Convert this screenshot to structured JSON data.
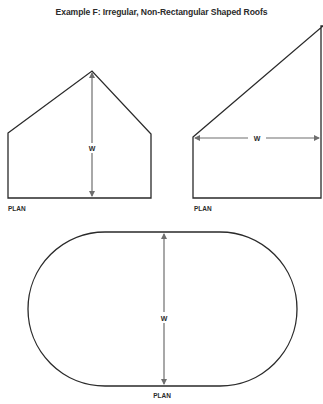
{
  "title": "Example F: Irregular, Non-Rectangular Shaped Roofs",
  "colors": {
    "outline": "#2a2a2a",
    "dimension_arrow": "#6e6e6e",
    "text": "#2b2b2b",
    "background": "#ffffff"
  },
  "figures": [
    {
      "id": "pentagon",
      "description": "Five-sided plan with gabled point",
      "dimension_label": "W",
      "plan_label": "PLAN"
    },
    {
      "id": "trapezoid",
      "description": "Four-sided plan with sloped top edge",
      "dimension_label": "W",
      "plan_label": "PLAN"
    },
    {
      "id": "stadium",
      "description": "Rounded-end (stadium) plan",
      "dimension_label": "W",
      "plan_label": "PLAN"
    }
  ]
}
